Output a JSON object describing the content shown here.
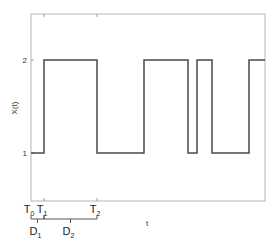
{
  "chart_data": {
    "type": "line",
    "step": true,
    "title": "",
    "xlabel": "t",
    "ylabel": "X(t)",
    "xlim": [
      0,
      234
    ],
    "ylim": [
      0.5,
      2.65
    ],
    "yticks": [
      1,
      2
    ],
    "ytick_labels": [
      "1",
      "2"
    ],
    "grid": false,
    "series": [
      {
        "name": "X(t)",
        "points": [
          {
            "t": 0,
            "x": 1
          },
          {
            "t": 13,
            "x": 2
          },
          {
            "t": 66,
            "x": 1
          },
          {
            "t": 113,
            "x": 2
          },
          {
            "t": 157,
            "x": 1
          },
          {
            "t": 166,
            "x": 2
          },
          {
            "t": 181,
            "x": 1
          },
          {
            "t": 218,
            "x": 2
          },
          {
            "t": 234,
            "x": 2
          }
        ]
      }
    ],
    "time_markers": [
      {
        "label": "T",
        "sub": "0",
        "t": 0
      },
      {
        "label": "T",
        "sub": "1",
        "t": 13
      },
      {
        "label": "T",
        "sub": "2",
        "t": 66
      }
    ],
    "durations": [
      {
        "label": "D",
        "sub": "1",
        "from": 0,
        "to": 13
      },
      {
        "label": "D",
        "sub": "2",
        "from": 13,
        "to": 66
      }
    ],
    "colors": {
      "signal": "#4a4a4a",
      "axis": "#b5b5b5"
    }
  }
}
